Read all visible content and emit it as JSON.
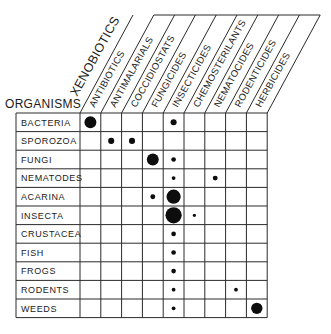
{
  "diagram": {
    "super_header": "XENOBIOTICS",
    "row_header": "ORGANISMS",
    "columns": [
      "ANTIBIOTICS",
      "ANTIMALARIALS",
      "COCCIDIOSTATS",
      "FUNGICIDES",
      "INSECTICIDES",
      "CHEMOSTERILANTS",
      "NEMATOCIDES",
      "RODENTICIDES",
      "HERBICIDES"
    ],
    "rows": [
      "BACTERIA",
      "SPOROZOA",
      "FUNGI",
      "NEMATODES",
      "ACARINA",
      "INSECTA",
      "CRUSTACEA",
      "FISH",
      "FROGS",
      "RODENTS",
      "WEEDS"
    ],
    "dot_size_legend": "dot radius indicates relative magnitude (1=tiny ... 5=very large)",
    "cells": [
      {
        "row": "BACTERIA",
        "col": "ANTIBIOTICS",
        "size": 4
      },
      {
        "row": "BACTERIA",
        "col": "INSECTICIDES",
        "size": 2
      },
      {
        "row": "SPOROZOA",
        "col": "ANTIMALARIALS",
        "size": 2
      },
      {
        "row": "SPOROZOA",
        "col": "COCCIDIOSTATS",
        "size": 2
      },
      {
        "row": "FUNGI",
        "col": "FUNGICIDES",
        "size": 4
      },
      {
        "row": "FUNGI",
        "col": "INSECTICIDES",
        "size": 1.5
      },
      {
        "row": "NEMATODES",
        "col": "INSECTICIDES",
        "size": 1.2
      },
      {
        "row": "NEMATODES",
        "col": "NEMATOCIDES",
        "size": 1.6
      },
      {
        "row": "ACARINA",
        "col": "FUNGICIDES",
        "size": 1.6
      },
      {
        "row": "ACARINA",
        "col": "INSECTICIDES",
        "size": 4.8
      },
      {
        "row": "INSECTA",
        "col": "INSECTICIDES",
        "size": 5.5
      },
      {
        "row": "INSECTA",
        "col": "CHEMOSTERILANTS",
        "size": 1
      },
      {
        "row": "CRUSTACEA",
        "col": "INSECTICIDES",
        "size": 1.5
      },
      {
        "row": "FISH",
        "col": "INSECTICIDES",
        "size": 1.5
      },
      {
        "row": "FROGS",
        "col": "INSECTICIDES",
        "size": 1.5
      },
      {
        "row": "RODENTS",
        "col": "INSECTICIDES",
        "size": 1.2
      },
      {
        "row": "RODENTS",
        "col": "RODENTICIDES",
        "size": 1.2
      },
      {
        "row": "WEEDS",
        "col": "INSECTICIDES",
        "size": 1.2
      },
      {
        "row": "WEEDS",
        "col": "HERBICIDES",
        "size": 3.8
      }
    ]
  }
}
